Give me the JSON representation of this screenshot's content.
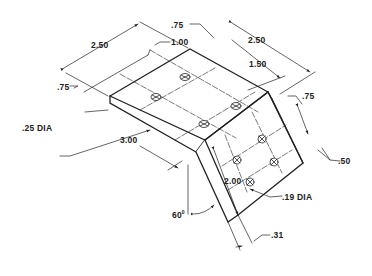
{
  "drawing": {
    "type": "isometric bent bracket",
    "dimensions": {
      "top_length": "2.50",
      "hole_offset_top": "1.00",
      "edge_offset_top": ".75",
      "right_width": "2.50",
      "hole_spacing_right": "1.50",
      "hole_dia_large": ".25 DIA",
      "top_depth": "3.00",
      "flange_hole_offset": ".75",
      "flange_edge_offset": ".50",
      "flange_length": "2.00",
      "hole_dia_small": ".19 DIA",
      "bend_angle": "60",
      "bend_angle_unit": "0",
      "thickness": ".31"
    },
    "colors": {
      "line": "#222222",
      "background": "#ffffff"
    }
  }
}
